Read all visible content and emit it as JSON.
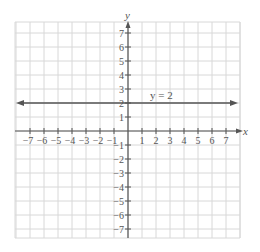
{
  "graph": {
    "x_axis_label": "x",
    "y_axis_label": "y",
    "x_range": [
      -7,
      7
    ],
    "y_range": [
      -7,
      7
    ],
    "x_ticks": [
      "-7",
      "-6",
      "-5",
      "-4",
      "-3",
      "-2",
      "-1",
      "1",
      "2",
      "3",
      "4",
      "5",
      "6",
      "7"
    ],
    "y_ticks": [
      "7",
      "6",
      "5",
      "4",
      "3",
      "2",
      "1",
      "-1",
      "-2",
      "-3",
      "-4",
      "-5",
      "-6",
      "-7"
    ],
    "line_label": "y = 2",
    "line_equation": "y = 2",
    "colors": {
      "grid": "#d8d8d8",
      "axis": "#555555",
      "line": "#555555"
    }
  }
}
